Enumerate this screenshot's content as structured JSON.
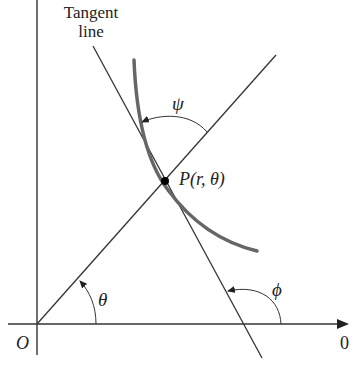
{
  "diagram": {
    "title_labels": {
      "tangent_line_line1": "Tangent",
      "tangent_line_line2": "line"
    },
    "point_label": "P(r, θ)",
    "origin_label": "O",
    "polar_axis_label": "0",
    "angles": {
      "psi": "ψ",
      "theta": "θ",
      "phi": "ϕ"
    },
    "colors": {
      "line": "#333333",
      "curve": "#666666",
      "point": "#000000",
      "background": "#ffffff"
    }
  }
}
